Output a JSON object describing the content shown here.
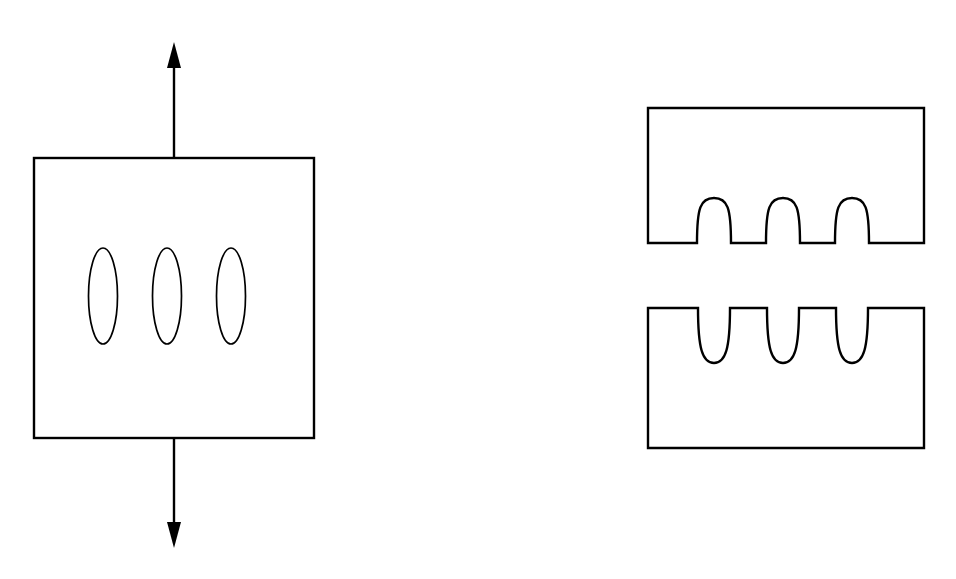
{
  "figure": {
    "domain": "diagram",
    "kind": "engineering-line-drawing",
    "background_color": "#ffffff",
    "stroke_color": "#000000",
    "canvas": {
      "width": 956,
      "height": 579
    }
  },
  "left_panel": {
    "name": "plate-with-elliptical-holes",
    "plate": {
      "shape": "square",
      "x": 34,
      "y": 158,
      "width": 280,
      "height": 280,
      "fill": "none",
      "stroke": "#000000",
      "stroke_width": 2.4
    },
    "holes": {
      "count": 3,
      "shape": "ellipse",
      "orientation": "vertical-major-axis",
      "center_y": 296,
      "radius_x": 14.5,
      "radius_y": 48,
      "centers_x": [
        103,
        167,
        231
      ]
    },
    "load_arrows": {
      "count": 2,
      "direction": "tension",
      "axis_x": 174,
      "top": {
        "name": "tension-arrow-up",
        "from_y": 158,
        "to_y": 42,
        "points": "up"
      },
      "bottom": {
        "name": "tension-arrow-down",
        "from_y": 438,
        "to_y": 548,
        "points": "down"
      },
      "head_length": 26,
      "head_half_width": 7
    }
  },
  "right_panel": {
    "name": "mating-blocks-with-interlocking-features",
    "upper_block": {
      "shape": "rectangle-with-domed-protrusions",
      "x": 648,
      "y": 108,
      "width": 276,
      "height": 135,
      "feature_edge": "bottom",
      "features": {
        "count": 3,
        "type": "dome-protrusion",
        "direction": "upward-into-block",
        "centers_x": [
          714,
          783,
          852
        ],
        "half_width": 17,
        "height": 45
      }
    },
    "lower_block": {
      "shape": "rectangle-with-u-grooves",
      "x": 648,
      "y": 308,
      "width": 276,
      "height": 140,
      "feature_edge": "top",
      "features": {
        "count": 3,
        "type": "u-groove",
        "direction": "downward-into-block",
        "centers_x": [
          714,
          783,
          852
        ],
        "half_width": 16,
        "depth": 55
      }
    },
    "gap_between_blocks": 65
  }
}
